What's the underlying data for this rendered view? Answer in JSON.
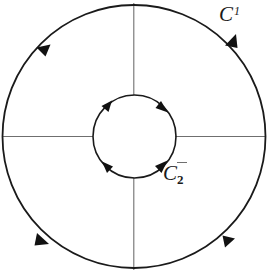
{
  "figure": {
    "background_color": "#ffffff",
    "stroke_color": "#1a1a1a",
    "thin_stroke_color": "#6f6f6f",
    "width": 270,
    "height": 276
  },
  "labels": {
    "outer_curve": {
      "name": "C",
      "base": "C",
      "superscript": "1",
      "full_text": "C1",
      "x": 219,
      "y": 4
    },
    "inner_curve": {
      "name": "C",
      "base": "C",
      "subscript": "2",
      "full_text": "C2",
      "x": 163,
      "y": 163,
      "has_overmark": true
    }
  },
  "geometry": {
    "center_x": 134,
    "center_y": 136,
    "outer_circle": {
      "radius": 131,
      "orientation": "counterclockwise",
      "arrow_count": 4
    },
    "inner_circle": {
      "radius": 41,
      "orientation": "clockwise",
      "arrow_count": 4
    },
    "radial_lines": {
      "count": 4,
      "angles_deg": [
        0,
        90,
        180,
        270
      ]
    }
  },
  "arrows": {
    "outer": [
      {
        "name": "outer-arrow-upper-left",
        "angle_deg": 133,
        "direction": "counterclockwise"
      },
      {
        "name": "outer-arrow-upper-right",
        "angle_deg": 43,
        "direction": "counterclockwise"
      },
      {
        "name": "outer-arrow-lower-left",
        "angle_deg": 223,
        "direction": "counterclockwise"
      },
      {
        "name": "outer-arrow-lower-right",
        "angle_deg": 314,
        "direction": "counterclockwise"
      }
    ],
    "inner": [
      {
        "name": "inner-arrow-upper-left",
        "angle_deg": 133,
        "direction": "clockwise"
      },
      {
        "name": "inner-arrow-upper-right",
        "angle_deg": 47,
        "direction": "clockwise"
      },
      {
        "name": "inner-arrow-lower-left",
        "angle_deg": 227,
        "direction": "clockwise"
      },
      {
        "name": "inner-arrow-lower-right",
        "angle_deg": 313,
        "direction": "clockwise"
      }
    ]
  }
}
